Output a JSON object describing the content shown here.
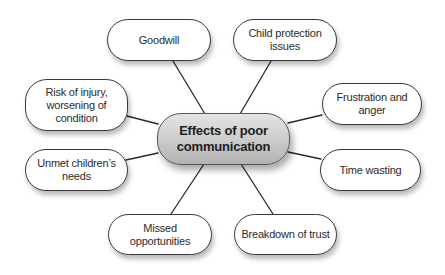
{
  "diagram": {
    "type": "mind-map",
    "center": {
      "label": "Effects of poor\ncommunication",
      "fill_top": "#e4e4e4",
      "fill_bottom": "#b2b2b2"
    },
    "nodes": [
      {
        "id": "goodwill",
        "label": "Goodwill"
      },
      {
        "id": "child-protection",
        "label": "Child protection\nissues"
      },
      {
        "id": "risk-of-injury",
        "label": "Risk of injury,\nworsening of\ncondition"
      },
      {
        "id": "frustration",
        "label": "Frustration and\nanger"
      },
      {
        "id": "unmet-needs",
        "label": "Unmet children’s\nneeds"
      },
      {
        "id": "time-wasting",
        "label": "Time wasting"
      },
      {
        "id": "missed-opportunities",
        "label": "Missed opportunities"
      },
      {
        "id": "breakdown-of-trust",
        "label": "Breakdown of trust"
      }
    ],
    "colors": {
      "background": "#ffffff",
      "node_fill": "#ffffff",
      "node_border": "#3a3a3a",
      "connector": "#2a2a2a",
      "text": "#2b2b2b"
    }
  }
}
